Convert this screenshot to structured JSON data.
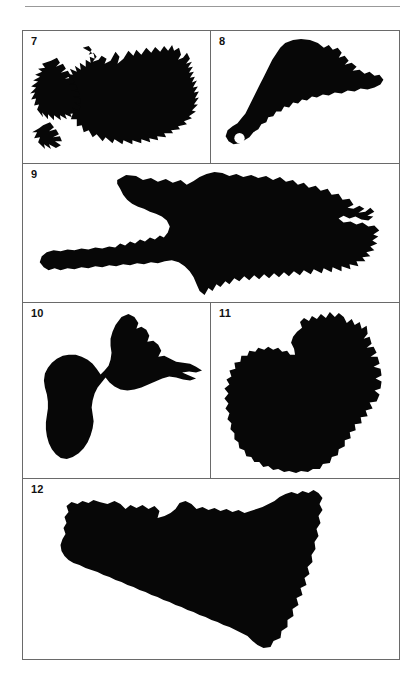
{
  "page": {
    "running_head": "ISLAND OUTLINES",
    "background_color": "#ffffff",
    "silhouette_color": "#070707",
    "border_color": "#6a6a6a",
    "rule_color": "#999999"
  },
  "figure": {
    "layout": "4-row grid of bordered panels, numbered 7 through 12",
    "rows": [
      {
        "cells": [
          {
            "number": "7",
            "subject": "Iceland",
            "hole": false
          },
          {
            "number": "8",
            "subject": "Trinidad",
            "hole": true
          }
        ]
      },
      {
        "cells": [
          {
            "number": "9",
            "subject": "Hispaniola",
            "hole": false
          }
        ]
      },
      {
        "cells": [
          {
            "number": "10",
            "subject": "Guadeloupe",
            "hole": false
          },
          {
            "number": "11",
            "subject": "Borneo",
            "hole": false
          }
        ]
      },
      {
        "cells": [
          {
            "number": "12",
            "subject": "Sicily",
            "hole": false
          }
        ]
      }
    ]
  }
}
